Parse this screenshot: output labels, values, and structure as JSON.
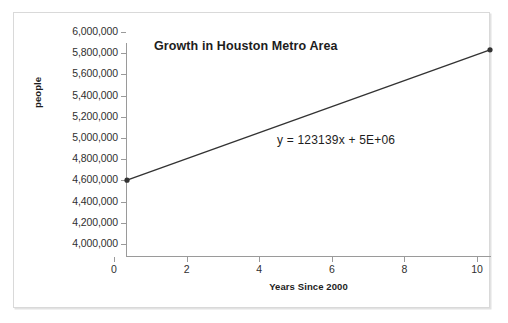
{
  "chart_data": {
    "type": "line",
    "title": "Growth in Houston Metro Area",
    "xlabel": "Years Since 2000",
    "ylabel": "people",
    "xlim": [
      0,
      10
    ],
    "ylim": [
      4000000,
      6000000
    ],
    "grid": false,
    "legend": false,
    "x": [
      0,
      10
    ],
    "values": [
      4715000,
      5945000
    ],
    "series": [
      {
        "name": "people",
        "x": [
          0,
          10
        ],
        "values": [
          4715000,
          5945000
        ]
      }
    ],
    "x_tick_labels": [
      "0",
      "2",
      "4",
      "6",
      "8",
      "10"
    ],
    "x_tick_values": [
      0,
      2,
      4,
      6,
      8,
      10
    ],
    "y_tick_labels": [
      "6,000,000",
      "5,800,000",
      "5,600,000",
      "5,400,000",
      "5,200,000",
      "5,000,000",
      "4,800,000",
      "4,600,000",
      "4,400,000",
      "4,200,000",
      "4,000,000"
    ],
    "y_tick_values": [
      6000000,
      5800000,
      5600000,
      5400000,
      5200000,
      5000000,
      4800000,
      4600000,
      4400000,
      4200000,
      4000000
    ],
    "annotations": [
      {
        "name": "trendline-equation",
        "text": "y = 123139x + 5E+06",
        "slope": 123139,
        "intercept": 5000000
      }
    ],
    "colors": {
      "series_line": "#333333",
      "axis": "#9a9a9a",
      "text": "#2f2f2f",
      "frame": "#d9d9d9",
      "plot_background": "#ffffff"
    }
  }
}
